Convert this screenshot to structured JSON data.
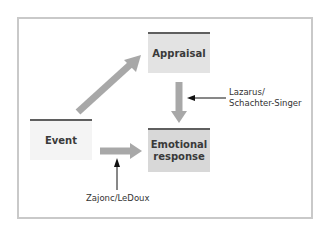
{
  "diagram": {
    "nodes": {
      "appraisal": {
        "label": "Appraisal"
      },
      "event": {
        "label": "Event"
      },
      "emotional_response": {
        "line1": "Emotional",
        "line2": "response"
      }
    },
    "annotations": {
      "lazarus": {
        "line1": "Lazarus/",
        "line2": "Schachter-Singer"
      },
      "zajonc": {
        "label": "Zajonc/LeDoux"
      }
    },
    "edges": [
      {
        "from": "Event",
        "to": "Appraisal"
      },
      {
        "from": "Appraisal",
        "to": "Emotional response",
        "annotation": "Lazarus/Schachter-Singer"
      },
      {
        "from": "Event",
        "to": "Emotional response",
        "annotation": "Zajonc/LeDoux"
      }
    ],
    "colors": {
      "frame": "#c9c9c9",
      "thick_arrow": "#a8a8a8",
      "thin_arrow": "#111111",
      "box_topbar": "#5f5f5f",
      "appraisal_fill": "#e3e3e3",
      "event_fill": "#f4f4f4",
      "emotional_fill": "#d8d8d8"
    }
  }
}
